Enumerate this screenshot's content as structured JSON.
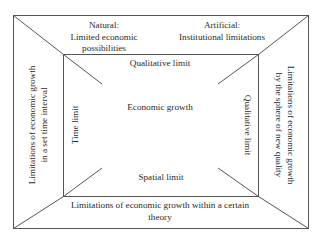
{
  "diagram": {
    "type": "nested-frame",
    "colors": {
      "line": "#555555",
      "text": "#2a2a2a",
      "background": "#ffffff"
    },
    "outer_sections": {
      "top_left": {
        "lines": [
          "Natural:",
          "Limited economic",
          "possibilities"
        ]
      },
      "top_right": {
        "lines": [
          "Artificial:",
          "Institutional limitations"
        ]
      },
      "left": {
        "lines": [
          "Limitations of economic growth",
          "in a set time interval"
        ]
      },
      "right": {
        "lines": [
          "Limitations of economic growth",
          "by the sphere of new quality"
        ]
      },
      "bottom": {
        "lines": [
          "Limitations of economic growth within a certain",
          "theory"
        ]
      }
    },
    "inner_sections": {
      "top": "Qualitative limit",
      "left": "Time limit",
      "right": "Qualitative limit",
      "bottom": "Spatial limit",
      "center": "Economic growth"
    }
  }
}
